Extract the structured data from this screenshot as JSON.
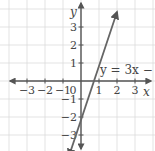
{
  "chart_data": {
    "type": "line",
    "title": "",
    "xlabel": "x",
    "ylabel": "y",
    "xlim": [
      -4,
      4
    ],
    "ylim": [
      -4,
      4
    ],
    "grid": true,
    "x_ticks": [
      -3,
      -2,
      -1,
      0,
      1,
      2,
      3
    ],
    "y_ticks": [
      -3,
      -2,
      -1,
      1,
      2,
      3
    ],
    "x_tick_labels": [
      "−3",
      "−2",
      "−1",
      "0",
      "1",
      "2",
      "3"
    ],
    "y_tick_labels": [
      "−3",
      "−2",
      "−1",
      "1",
      "2",
      "3"
    ],
    "series": [
      {
        "name": "y = 3x − 2",
        "equation": "y = 3x − 2",
        "slope": 3,
        "intercept": -2,
        "x": [
          -0.6667,
          2
        ],
        "y": [
          -4,
          4
        ],
        "color": "#555555"
      }
    ],
    "annotations": [
      {
        "text": "y = 3x − 2",
        "x": 1.0,
        "y": 0.6
      }
    ]
  },
  "colors": {
    "grid": "#dcdcdc",
    "axis": "#555555",
    "line": "#666666",
    "text": "#444444"
  }
}
